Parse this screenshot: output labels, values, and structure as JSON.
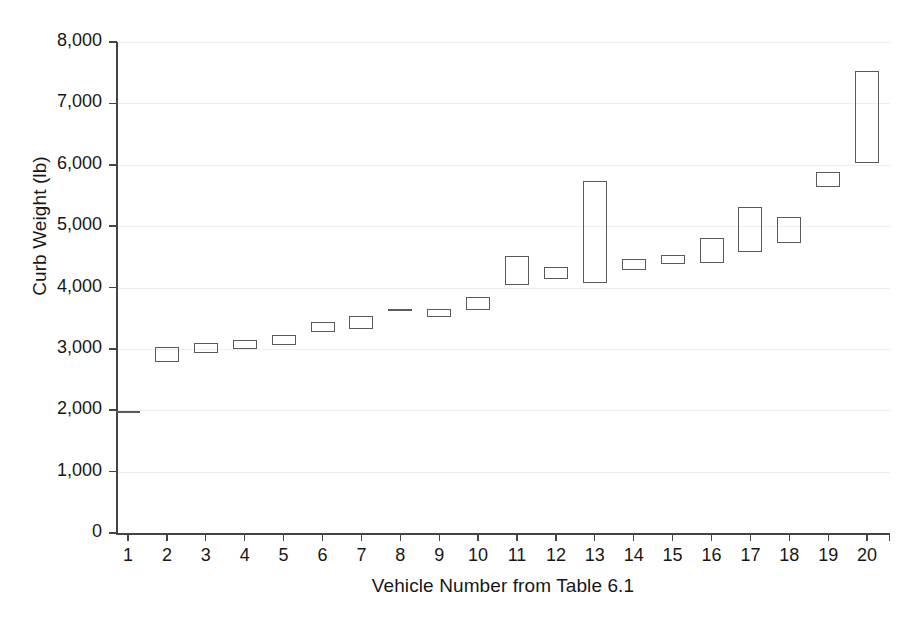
{
  "chart_data": {
    "type": "bar",
    "subtype": "floating-range-bar",
    "title": "",
    "xlabel": "Vehicle Number from Table 6.1",
    "ylabel": "Curb Weight (lb)",
    "categories": [
      "1",
      "2",
      "3",
      "4",
      "5",
      "6",
      "7",
      "8",
      "9",
      "10",
      "11",
      "12",
      "13",
      "14",
      "15",
      "16",
      "17",
      "18",
      "19",
      "20"
    ],
    "ytick_labels": [
      "0",
      "1,000",
      "2,000",
      "3,000",
      "4,000",
      "5,000",
      "6,000",
      "7,000",
      "8,000"
    ],
    "ytick_values": [
      0,
      1000,
      2000,
      3000,
      4000,
      5000,
      6000,
      7000,
      8000
    ],
    "ylim": [
      0,
      8000
    ],
    "grid": true,
    "grid_axis": "y",
    "legend": "none",
    "marker_color": "#5a5a5a",
    "series": [
      {
        "name": "Curb Weight Range (lb)",
        "points": [
          {
            "x": "1",
            "low": 1970,
            "high": 1970
          },
          {
            "x": "2",
            "low": 2785,
            "high": 3030
          },
          {
            "x": "3",
            "low": 2925,
            "high": 3095
          },
          {
            "x": "4",
            "low": 2990,
            "high": 3140
          },
          {
            "x": "5",
            "low": 3060,
            "high": 3220
          },
          {
            "x": "6",
            "low": 3270,
            "high": 3435
          },
          {
            "x": "7",
            "low": 3320,
            "high": 3540
          },
          {
            "x": "8",
            "low": 3630,
            "high": 3630
          },
          {
            "x": "9",
            "low": 3520,
            "high": 3650
          },
          {
            "x": "10",
            "low": 3630,
            "high": 3845
          },
          {
            "x": "11",
            "low": 4040,
            "high": 4510
          },
          {
            "x": "12",
            "low": 4140,
            "high": 4340
          },
          {
            "x": "13",
            "low": 4070,
            "high": 5735
          },
          {
            "x": "14",
            "low": 4285,
            "high": 4465
          },
          {
            "x": "15",
            "low": 4385,
            "high": 4530
          },
          {
            "x": "16",
            "low": 4400,
            "high": 4810
          },
          {
            "x": "17",
            "low": 4580,
            "high": 5310
          },
          {
            "x": "18",
            "low": 4725,
            "high": 5150
          },
          {
            "x": "19",
            "low": 5640,
            "high": 5885
          },
          {
            "x": "20",
            "low": 6030,
            "high": 7525
          }
        ]
      }
    ]
  },
  "axis": {
    "y_title": "Curb Weight (lb)",
    "x_title": "Vehicle Number from Table 6.1"
  }
}
